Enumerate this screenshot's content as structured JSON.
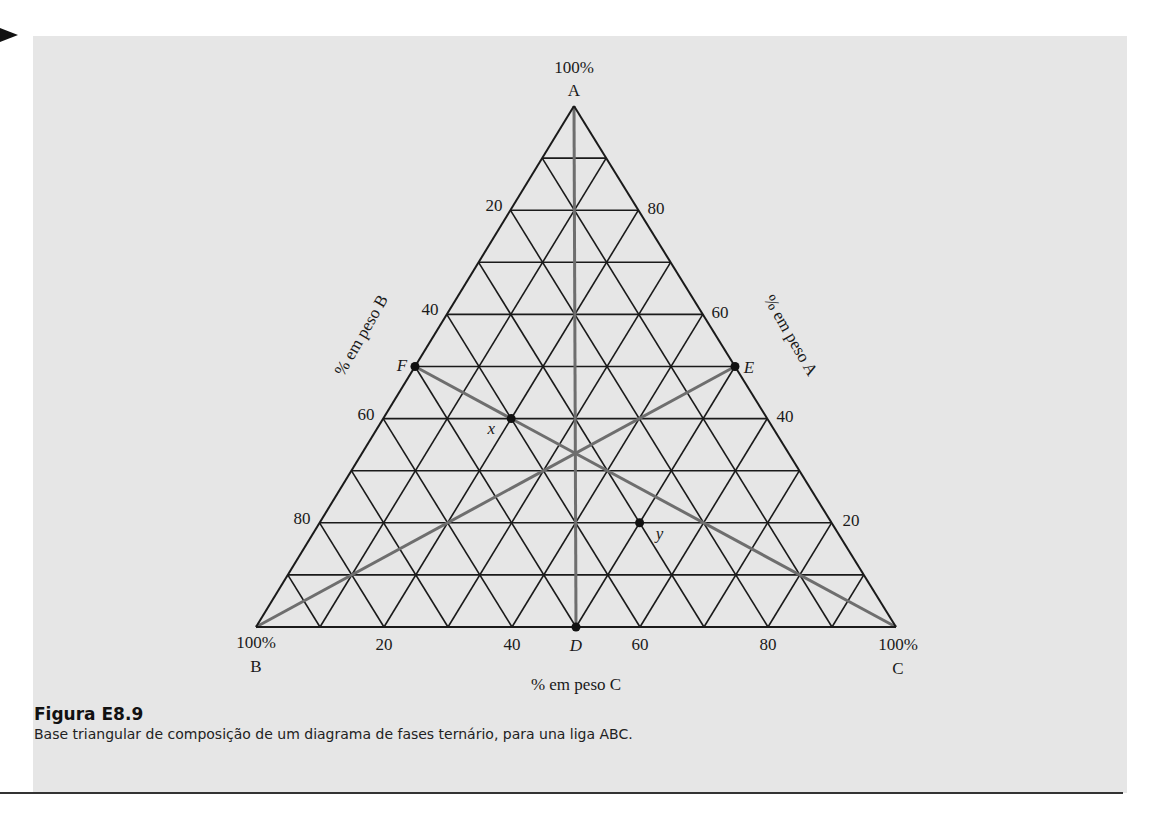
{
  "figure": {
    "title": "Figura E8.9",
    "caption": "Base triangular de composição de um diagrama de fases ternário, para una liga ABC."
  },
  "vertices": {
    "A": {
      "label": "A",
      "percent": "100%"
    },
    "B": {
      "label": "B",
      "percent": "100%"
    },
    "C": {
      "label": "C",
      "percent": "100%"
    }
  },
  "axes": {
    "left": {
      "label": "% em peso B",
      "ticks": [
        "20",
        "40",
        "60",
        "80"
      ]
    },
    "right": {
      "label": "% em peso A",
      "ticks": [
        "80",
        "60",
        "40",
        "20"
      ]
    },
    "bottom": {
      "label": "% em peso C",
      "ticks": [
        "20",
        "40",
        "60",
        "80"
      ]
    }
  },
  "grid": {
    "divisions": 10,
    "step_percent": 10
  },
  "points": [
    {
      "id": "F",
      "label": "F",
      "A": 50,
      "B": 50,
      "C": 0
    },
    {
      "id": "E",
      "label": "E",
      "A": 50,
      "B": 0,
      "C": 50
    },
    {
      "id": "D",
      "label": "D",
      "A": 0,
      "B": 50,
      "C": 50
    },
    {
      "id": "x",
      "label": "x",
      "A": 40,
      "B": 40,
      "C": 20
    },
    {
      "id": "y",
      "label": "y",
      "A": 20,
      "B": 30,
      "C": 50
    }
  ],
  "gray_lines": [
    {
      "from": "A",
      "to": "D"
    },
    {
      "from": "F",
      "to": "C"
    },
    {
      "from": "B",
      "to": "E"
    }
  ],
  "colors": {
    "grid": "#1a1a1a",
    "gray_line": "#6e6e6e",
    "panel": "#e6e6e6"
  }
}
